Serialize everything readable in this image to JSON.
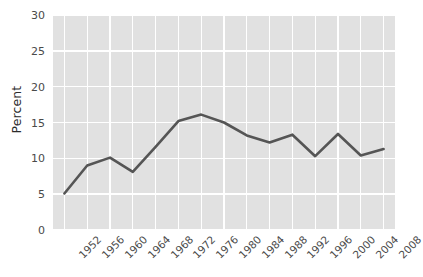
{
  "chart_data": {
    "type": "line",
    "title": "",
    "xlabel": "",
    "ylabel": "Percent",
    "categories": [
      "1952",
      "1956",
      "1960",
      "1964",
      "1968",
      "1972",
      "1976",
      "1980",
      "1984",
      "1988",
      "1992",
      "1996",
      "2000",
      "2004",
      "2008"
    ],
    "values": [
      5.1,
      9.0,
      10.1,
      8.1,
      11.6,
      15.2,
      16.1,
      15.0,
      13.2,
      12.2,
      13.3,
      10.3,
      13.4,
      10.4,
      11.3
    ],
    "series": [
      {
        "name": "Percent",
        "values": [
          5.1,
          9.0,
          10.1,
          8.1,
          11.6,
          15.2,
          16.1,
          15.0,
          13.2,
          12.2,
          13.3,
          10.3,
          13.4,
          10.4,
          11.3
        ]
      }
    ],
    "ylim": [
      0,
      30
    ],
    "yticks": [
      0,
      5,
      10,
      15,
      20,
      25,
      30
    ],
    "ytick_labels": [
      "0",
      "5",
      "10",
      "15",
      "20",
      "25",
      "30"
    ],
    "xtick_labels": [
      "1952",
      "1956",
      "1960",
      "1964",
      "1968",
      "1972",
      "1976",
      "1980",
      "1984",
      "1988",
      "1992",
      "1996",
      "2000",
      "2004",
      "2008"
    ],
    "grid": true,
    "legend": "none",
    "line_color": "#555555",
    "panel_background": "#e1e1e1",
    "gridline_color": "#ffffff",
    "axis_text_color": "#4a4a4a",
    "axis_title_color": "#2b2b2b"
  }
}
